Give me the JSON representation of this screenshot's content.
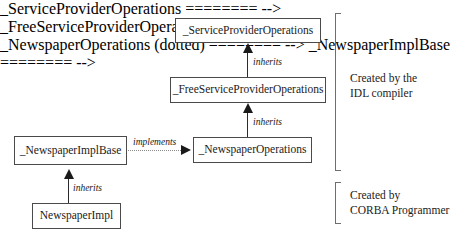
{
  "diagram": {
    "background_color": "#ffffff",
    "line_color": "#2b2b2b",
    "box_border_color": "#4a4a4a",
    "text_color": "#1a1a1a",
    "classes": [
      {
        "id": "service_provider_operations",
        "label": "_ServiceProviderOperations"
      },
      {
        "id": "free_service_provider_operations",
        "label": "_FreeServiceProviderOperations"
      },
      {
        "id": "newspaper_operations",
        "label": "_NewspaperOperations"
      },
      {
        "id": "newspaper_impl_base",
        "label": "_NewspaperImplBase"
      },
      {
        "id": "newspaper_impl",
        "label": "NewspaperImpl"
      }
    ],
    "edges": [
      {
        "id": "fspo_to_spo",
        "label": "inherits",
        "style": "solid",
        "from": "_FreeServiceProviderOperations",
        "to": "_ServiceProviderOperations"
      },
      {
        "id": "npo_to_fspo",
        "label": "inherits",
        "style": "solid",
        "from": "_NewspaperOperations",
        "to": "_FreeServiceProviderOperations"
      },
      {
        "id": "nib_to_npo",
        "label": "implements",
        "style": "dotted",
        "from": "_NewspaperImplBase",
        "to": "_NewspaperOperations"
      },
      {
        "id": "ni_to_nib",
        "label": "inherits",
        "style": "solid",
        "from": "NewspaperImpl",
        "to": "_NewspaperImplBase"
      }
    ],
    "groups": [
      {
        "id": "idl_compiler_group",
        "line1": "Created by the",
        "line2": "IDL compiler"
      },
      {
        "id": "corba_programmer_group",
        "line1": "Created by",
        "line2": "CORBA Programmer"
      }
    ]
  }
}
